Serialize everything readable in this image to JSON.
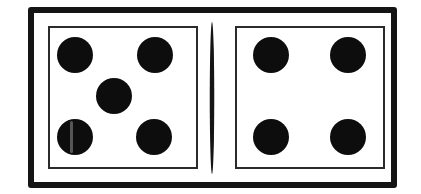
{
  "scene": {
    "kind": "domino-tile",
    "background_color": "#ffffff",
    "width": 421,
    "height": 194
  },
  "tile": {
    "name": "domino",
    "border_color": "#141414",
    "face_color": "#ffffff",
    "pip_color": "#0d0d0d",
    "divider_color": "#151515",
    "total_pips": 9,
    "notation": "5-4"
  },
  "halves": [
    {
      "id": "left",
      "label": "left-half",
      "pip_count": 5,
      "pattern": "quincunx",
      "pips": [
        {
          "id": "left-pip-top-left",
          "x": 75,
          "y": 55,
          "d": 36,
          "streak": false
        },
        {
          "id": "left-pip-top-right",
          "x": 155,
          "y": 55,
          "d": 36,
          "streak": false
        },
        {
          "id": "left-pip-center",
          "x": 114,
          "y": 96,
          "d": 36,
          "streak": false
        },
        {
          "id": "left-pip-bottom-left",
          "x": 75,
          "y": 137,
          "d": 36,
          "streak": true
        },
        {
          "id": "left-pip-bottom-right",
          "x": 154,
          "y": 137,
          "d": 36,
          "streak": false
        }
      ]
    },
    {
      "id": "right",
      "label": "right-half",
      "pip_count": 4,
      "pattern": "square",
      "pips": [
        {
          "id": "right-pip-top-left",
          "x": 271,
          "y": 55,
          "d": 36,
          "streak": false
        },
        {
          "id": "right-pip-top-right",
          "x": 348,
          "y": 55,
          "d": 36,
          "streak": false
        },
        {
          "id": "right-pip-bottom-left",
          "x": 271,
          "y": 137,
          "d": 36,
          "streak": false
        },
        {
          "id": "right-pip-bottom-right",
          "x": 348,
          "y": 137,
          "d": 36,
          "streak": false
        }
      ]
    }
  ],
  "divider": {
    "id": "center-divider",
    "shape": "lens",
    "center_x": 212,
    "top": 22,
    "bottom": 174
  }
}
